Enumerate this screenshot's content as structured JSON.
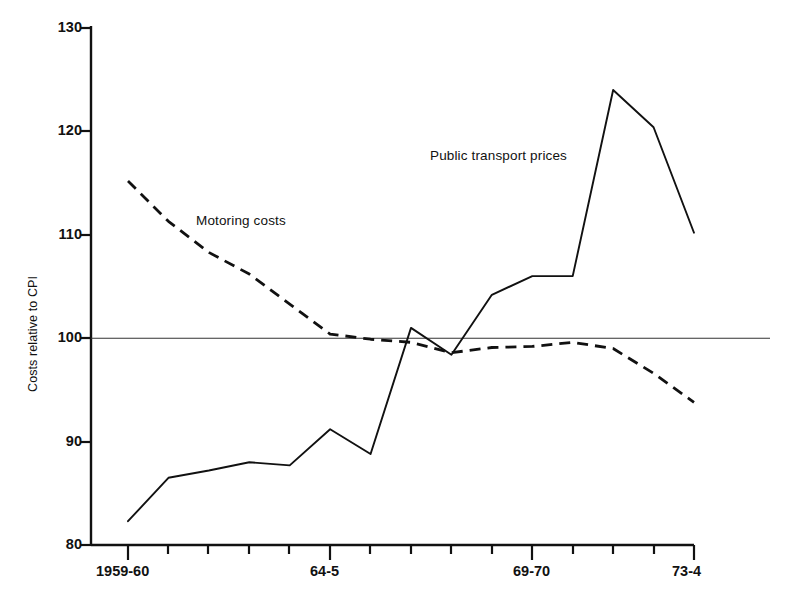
{
  "chart_data": {
    "type": "line",
    "title": "",
    "xlabel": "",
    "ylabel": "Costs relative to CPI",
    "ylim": [
      80,
      130
    ],
    "yticks": [
      80,
      90,
      100,
      110,
      120,
      130
    ],
    "grid": false,
    "reference_line": 100,
    "legend_position": "inline-annotations",
    "x": [
      "1959-60",
      "60-1",
      "61-2",
      "62-3",
      "63-4",
      "64-5",
      "65-6",
      "66-7",
      "67-8",
      "68-9",
      "69-70",
      "70-1",
      "71-2",
      "72-3",
      "73-4"
    ],
    "xtick_labels_shown": [
      "1959-60",
      "64-5",
      "69-70",
      "73-4"
    ],
    "xtick_label_indices": [
      0,
      5,
      10,
      14
    ],
    "series": [
      {
        "name": "Public transport prices",
        "style": "solid",
        "color": "#111111",
        "values": [
          82.3,
          86.5,
          87.2,
          88.0,
          87.7,
          91.2,
          88.8,
          101.0,
          98.4,
          104.2,
          106.0,
          106.0,
          124.0,
          120.4,
          110.2
        ]
      },
      {
        "name": "Motoring costs",
        "style": "dashed",
        "color": "#111111",
        "values": [
          115.2,
          111.3,
          108.3,
          106.2,
          103.3,
          100.4,
          99.9,
          99.6,
          98.6,
          99.1,
          99.2,
          99.6,
          99.0,
          96.6,
          93.8
        ]
      }
    ],
    "annotations": [
      {
        "text": "Motoring costs",
        "x_px": 196,
        "y_px": 220
      },
      {
        "text": "Public transport prices",
        "x_px": 430,
        "y_px": 155
      }
    ]
  },
  "axes": {
    "y_tick_labels": [
      "130",
      "120",
      "110",
      "100",
      "90",
      "80"
    ],
    "x_tick_labels": [
      "1959-60",
      "64-5",
      "69-70",
      "73-4"
    ],
    "y_axis_title": "Costs relative to CPI"
  },
  "labels": {
    "motoring": "Motoring costs",
    "public_transport": "Public transport prices"
  }
}
